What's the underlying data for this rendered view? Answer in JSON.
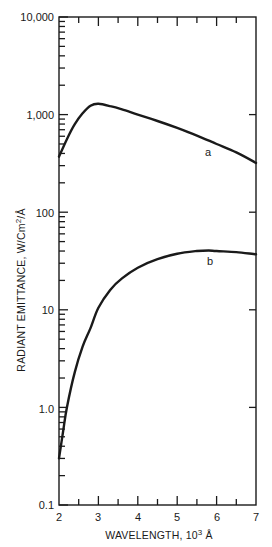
{
  "chart_data": {
    "type": "line",
    "title": "",
    "xlabel": "WAVELENGTH, 10³ Å",
    "xlabel_parts": {
      "main": "WAVELENGTH, 10",
      "sup": "3",
      "unit": " Å"
    },
    "ylabel": "RADIANT EMITTANCE, W/Cm²/Å",
    "ylabel_parts": {
      "main": "RADIANT EMITTANCE, W/Cm",
      "sup": "2",
      "unit": "/Å"
    },
    "xlim": [
      2,
      7
    ],
    "ylim": [
      0.1,
      10000
    ],
    "yscale": "log",
    "grid": false,
    "legend": "none (curves labeled inline)",
    "x_ticks": [
      2,
      3,
      4,
      5,
      6,
      7
    ],
    "x_tick_labels": [
      "2",
      "3",
      "4",
      "5",
      "6",
      "7"
    ],
    "y_ticks": [
      0.1,
      1,
      10,
      100,
      1000,
      10000
    ],
    "y_tick_labels": [
      "0.1",
      "1.0",
      "10",
      "100",
      "1,000",
      "10,000"
    ],
    "series": [
      {
        "name": "a",
        "x": [
          2.0,
          2.2,
          2.4,
          2.6,
          2.8,
          3.0,
          3.3,
          3.6,
          4.0,
          4.5,
          5.0,
          5.5,
          6.0,
          6.5,
          7.0
        ],
        "values": [
          370,
          560,
          800,
          1030,
          1230,
          1290,
          1220,
          1130,
          1000,
          860,
          730,
          610,
          500,
          410,
          320
        ],
        "label_pos": {
          "x": 5.6,
          "value": 470
        }
      },
      {
        "name": "b",
        "x": [
          2.0,
          2.1,
          2.2,
          2.4,
          2.6,
          2.8,
          3.0,
          3.3,
          3.6,
          4.0,
          4.5,
          5.0,
          5.5,
          5.8,
          6.0,
          6.5,
          7.0
        ],
        "values": [
          0.3,
          0.55,
          1.0,
          2.3,
          4.2,
          6.5,
          10.5,
          16,
          21,
          27,
          33,
          37.5,
          40,
          40.5,
          40,
          39,
          37
        ],
        "label_pos": {
          "x": 5.75,
          "value": 31
        }
      }
    ]
  },
  "axis": {
    "x_tick_labels": [
      "2",
      "3",
      "4",
      "5",
      "6",
      "7"
    ],
    "y_tick_labels": [
      "0.1",
      "1.0",
      "10",
      "100",
      "1,000",
      "10,000"
    ]
  },
  "series_labels": {
    "a": "a",
    "b": "b"
  }
}
